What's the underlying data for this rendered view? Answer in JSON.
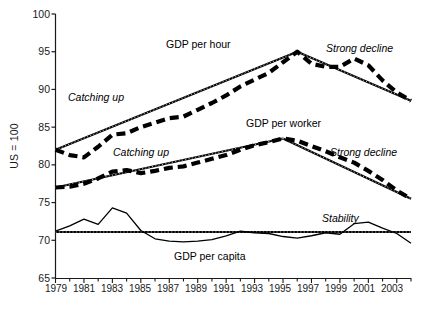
{
  "chart_data": {
    "type": "line",
    "title": "",
    "xlabel": "",
    "ylabel": "US = 100",
    "xlim": [
      1979,
      2004
    ],
    "ylim": [
      65,
      100
    ],
    "grid": false,
    "legend_position": "inline-annotations",
    "x": [
      1979,
      1980,
      1981,
      1982,
      1983,
      1984,
      1985,
      1986,
      1987,
      1988,
      1989,
      1990,
      1991,
      1992,
      1993,
      1994,
      1995,
      1996,
      1997,
      1998,
      1999,
      2000,
      2001,
      2002,
      2003,
      2004
    ],
    "yticks": [
      65,
      70,
      75,
      80,
      85,
      90,
      95,
      100
    ],
    "xticks_labeled": [
      1979,
      1981,
      1983,
      1985,
      1987,
      1989,
      1991,
      1993,
      1995,
      1997,
      1999,
      2001,
      2003
    ],
    "series": [
      {
        "name": "GDP per hour",
        "style": "dashed",
        "values": [
          82.0,
          81.3,
          81.0,
          82.4,
          84.0,
          84.2,
          85.0,
          85.6,
          86.2,
          86.4,
          87.3,
          88.2,
          89.2,
          90.4,
          91.3,
          92.2,
          93.6,
          95.0,
          93.4,
          93.0,
          93.0,
          94.1,
          93.2,
          91.2,
          89.6,
          88.5
        ]
      },
      {
        "name": "GDP per worker",
        "style": "dashed",
        "values": [
          77.0,
          77.1,
          77.5,
          78.2,
          79.1,
          79.3,
          78.9,
          79.2,
          79.6,
          79.8,
          80.3,
          80.8,
          81.3,
          82.0,
          82.6,
          83.0,
          83.5,
          83.2,
          82.5,
          81.8,
          81.0,
          80.3,
          79.2,
          78.0,
          76.6,
          75.5
        ]
      },
      {
        "name": "GDP per capita",
        "style": "solid-thin",
        "values": [
          71.2,
          71.9,
          72.8,
          72.1,
          74.3,
          73.6,
          71.3,
          70.2,
          69.9,
          69.8,
          69.9,
          70.1,
          70.6,
          71.2,
          71.0,
          70.9,
          70.5,
          70.3,
          70.6,
          71.0,
          70.8,
          72.2,
          72.4,
          71.6,
          70.9,
          69.6
        ]
      }
    ],
    "trend_lines": [
      {
        "name": "GDP per hour catching up",
        "label": "Catching up",
        "from": [
          1979,
          82.0
        ],
        "to": [
          1996,
          95.0
        ]
      },
      {
        "name": "GDP per hour strong decline",
        "label": "Strong decline",
        "from": [
          1996,
          95.0
        ],
        "to": [
          2004,
          88.5
        ]
      },
      {
        "name": "GDP per worker catching up",
        "label": "Catching up",
        "from": [
          1979,
          77.0
        ],
        "to": [
          1995,
          83.5
        ]
      },
      {
        "name": "GDP per worker strong decline",
        "label": "Strong decline",
        "from": [
          1995,
          83.5
        ],
        "to": [
          2004,
          75.5
        ]
      },
      {
        "name": "GDP per capita stability",
        "label": "Stability",
        "from": [
          1979,
          71.1
        ],
        "to": [
          2004,
          71.1
        ]
      }
    ],
    "annotations": [
      {
        "text": "GDP per hour",
        "x": 1988.0,
        "y": 96.6,
        "style": "upright"
      },
      {
        "text": "GDP per worker",
        "x": 1993.8,
        "y": 86.2,
        "style": "upright"
      },
      {
        "text": "GDP per capita",
        "x": 1989.5,
        "y": 67.9,
        "style": "upright"
      },
      {
        "text": "Catching up",
        "x": 1981.2,
        "y": 89.5,
        "style": "italic"
      },
      {
        "text": "Catching up",
        "x": 1984.3,
        "y": 83.1,
        "style": "italic"
      },
      {
        "text": "Strong decline",
        "x": 1999.0,
        "y": 96.6,
        "style": "italic"
      },
      {
        "text": "Strong decline",
        "x": 1999.2,
        "y": 81.0,
        "style": "italic"
      },
      {
        "text": "Stability",
        "x": 1999.0,
        "y": 73.0,
        "style": "italic"
      }
    ]
  },
  "axis": {
    "y_title": "US = 100",
    "y_tick_labels": [
      "100",
      "95",
      "90",
      "85",
      "80",
      "75",
      "70",
      "65"
    ],
    "x_tick_labels": [
      "1979",
      "1981",
      "1983",
      "1985",
      "1987",
      "1989",
      "1991",
      "1993",
      "1995",
      "1997",
      "1999",
      "2001",
      "2003"
    ]
  },
  "labels": {
    "gdp_per_hour": "GDP per hour",
    "gdp_per_worker": "GDP per worker",
    "gdp_per_capita": "GDP per capita",
    "catching_up_hour": "Catching up",
    "catching_up_worker": "Catching up",
    "strong_decline_hour": "Strong decline",
    "strong_decline_worker": "Strong decline",
    "stability": "Stability"
  },
  "colors": {
    "ink": "#000000",
    "background": "#ffffff",
    "axis": "#1a1a1a"
  }
}
